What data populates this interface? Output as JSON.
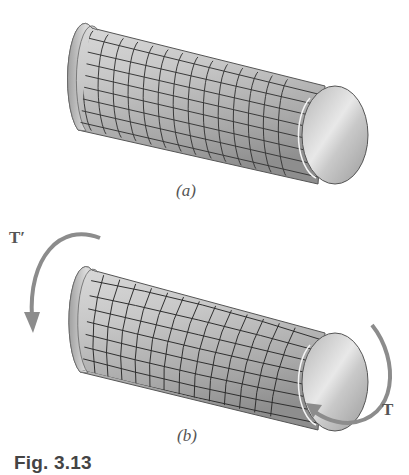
{
  "figure": {
    "caption": "Fig. 3.13",
    "panels": [
      {
        "id": "a",
        "label": "(a)",
        "state": "undeformed",
        "grid": "square"
      },
      {
        "id": "b",
        "label": "(b)",
        "state": "twisted",
        "grid": "distorted"
      }
    ],
    "torques": {
      "left": "T′",
      "right": "T"
    },
    "colors": {
      "arrow": "#8c8c8c",
      "grid": "#3a3a3a",
      "shaft_light": "#e4e4e4",
      "shaft_dark": "#9a9a9a",
      "text": "#555555"
    }
  }
}
